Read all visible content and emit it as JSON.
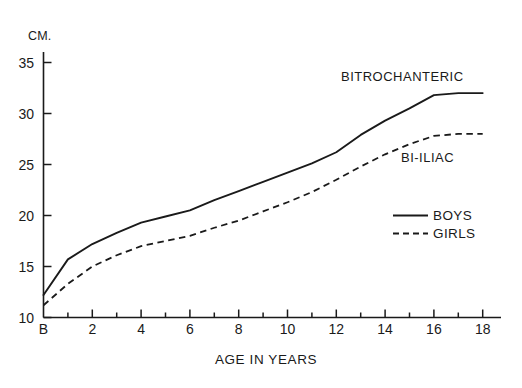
{
  "chart_data": {
    "type": "line",
    "title": "",
    "subtitle": "",
    "xlabel": "AGE IN YEARS",
    "ylabel": "CM.",
    "ylim": [
      10,
      36
    ],
    "xlim": [
      -0.55,
      19
    ],
    "grid": false,
    "legend_position": "inside-right",
    "y_unit_label": "CM.",
    "y_ticks": [
      10,
      15,
      20,
      25,
      30,
      35
    ],
    "y_tick_labels": [
      "10",
      "15",
      "20",
      "25",
      "30",
      "35"
    ],
    "x_ticks": [
      0,
      2,
      4,
      6,
      8,
      10,
      12,
      14,
      16,
      18
    ],
    "x_tick_labels": [
      "B",
      "2",
      "4",
      "6",
      "8",
      "10",
      "12",
      "14",
      "16",
      "18"
    ],
    "x_minor_ticks": [
      1,
      3,
      5,
      7,
      9,
      11,
      13,
      15,
      17
    ],
    "x": [
      0,
      1,
      2,
      3,
      4,
      5,
      6,
      7,
      8,
      9,
      10,
      11,
      12,
      13,
      14,
      15,
      16,
      17,
      18
    ],
    "series": [
      {
        "name": "BOYS",
        "annotation": "BITROCHANTERIC",
        "style": "solid",
        "color": "#1a1a1a",
        "values": [
          12.2,
          15.7,
          17.2,
          18.3,
          19.3,
          19.9,
          20.5,
          21.5,
          22.4,
          23.3,
          24.2,
          25.1,
          26.2,
          27.9,
          29.3,
          30.5,
          31.8,
          32.0,
          32.0
        ]
      },
      {
        "name": "GIRLS",
        "annotation": "BI-ILIAC",
        "style": "dashed",
        "color": "#1a1a1a",
        "values": [
          11.2,
          13.3,
          15.0,
          16.1,
          17.0,
          17.5,
          18.0,
          18.8,
          19.5,
          20.4,
          21.3,
          22.3,
          23.5,
          24.8,
          26.0,
          27.0,
          27.8,
          28.0,
          28.0
        ]
      }
    ],
    "annotations": [
      {
        "text": "BITROCHANTERIC",
        "x": 14.0,
        "y": 34.6
      },
      {
        "text": "BI-ILIAC",
        "x": 15.1,
        "y": 26.6
      }
    ],
    "legend": [
      {
        "label": "BOYS",
        "style": "solid"
      },
      {
        "label": "GIRLS",
        "style": "dashed"
      }
    ]
  },
  "figure": {
    "background_color": "#ffffff",
    "axis_color": "#1a1a1a"
  }
}
